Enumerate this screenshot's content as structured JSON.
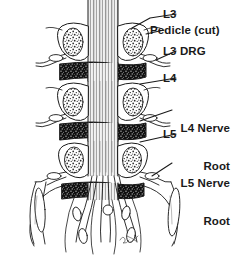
{
  "figure": {
    "ink_color": "#1a1a1a",
    "background_color": "#ffffff",
    "signature": "artist-signature"
  },
  "labels": [
    {
      "id": "l3",
      "text": "L3",
      "lines": [
        "L3"
      ]
    },
    {
      "id": "pedicle",
      "text": "Pedicle (cut)",
      "lines": [
        "Pedicle (cut)"
      ]
    },
    {
      "id": "l3drg",
      "text": "L3 DRG",
      "lines": [
        "L3 DRG"
      ]
    },
    {
      "id": "l4",
      "text": "L4",
      "lines": [
        "L4"
      ]
    },
    {
      "id": "l4nerve",
      "text": "L4 Nerve Root",
      "lines": [
        "L4 Nerve",
        "Root"
      ]
    },
    {
      "id": "l5",
      "text": "L5",
      "lines": [
        "L5"
      ]
    },
    {
      "id": "l5nerve",
      "text": "L5 Nerve Root",
      "lines": [
        "L5 Nerve",
        "Root"
      ]
    }
  ],
  "label_text": {
    "l3": "L3",
    "pedicle": "Pedicle (cut)",
    "l3drg": "L3 DRG",
    "l4": "L4",
    "l4nerve_line1": "L4 Nerve",
    "l4nerve_line2": "Root",
    "l5": "L5",
    "l5nerve_line1": "L5 Nerve",
    "l5nerve_line2": "Root"
  },
  "anatomy": {
    "structures": [
      "dural-sac",
      "cauda-equina",
      "vertebral-body-l3",
      "vertebral-body-l4",
      "vertebral-body-l5",
      "pedicle-cut-l3-left",
      "pedicle-cut-l3-right",
      "pedicle-cut-l4-left",
      "pedicle-cut-l4-right",
      "pedicle-cut-l5-left",
      "pedicle-cut-l5-right",
      "intervertebral-disc-l3-l4",
      "intervertebral-disc-l4-l5",
      "intervertebral-disc-l5-s1",
      "dorsal-root-ganglion-l3",
      "dorsal-root-ganglion-l4",
      "dorsal-root-ganglion-l5",
      "nerve-root-l3",
      "nerve-root-l4",
      "nerve-root-l5",
      "sacral-ala"
    ]
  }
}
